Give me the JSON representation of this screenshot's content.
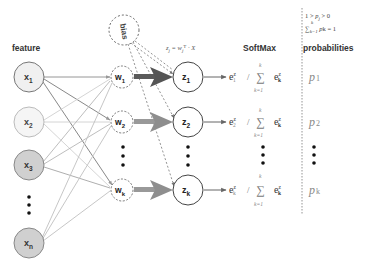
{
  "labels": {
    "feature": "feature",
    "softmax": "SoftMax",
    "probabilities": "probabilities",
    "bias": "bias",
    "linear_formula": "zj = wjT · X",
    "constraint_line1": "1 > pj > 0",
    "constraint_line2": "Σk=1 pk = 1"
  },
  "inputs": [
    {
      "id": "x1",
      "base": "x",
      "sub": "1",
      "fill": "#f0f0f0"
    },
    {
      "id": "x2",
      "base": "x",
      "sub": "2",
      "fill": "#f5f5f5"
    },
    {
      "id": "x3",
      "base": "x",
      "sub": "3",
      "fill": "#d0d0d0"
    },
    {
      "id": "xn",
      "base": "x",
      "sub": "n",
      "fill": "#d0d0d0"
    }
  ],
  "weights": [
    {
      "id": "w1",
      "base": "w",
      "sub": "1"
    },
    {
      "id": "w2",
      "base": "w",
      "sub": "2"
    },
    {
      "id": "wk",
      "base": "w",
      "sub": "k"
    }
  ],
  "logits": [
    {
      "id": "z1",
      "base": "z",
      "sub": "1"
    },
    {
      "id": "z2",
      "base": "z",
      "sub": "2"
    },
    {
      "id": "zk",
      "base": "z",
      "sub": "k"
    }
  ],
  "softmax": [
    {
      "num_base": "e",
      "num_sup": "z",
      "num_sub": "1",
      "slash": "/",
      "sum": "∑",
      "sum_top": "k",
      "sum_bottom": "k=1",
      "den_base": "e",
      "den_sup": "z",
      "den_sub": "k"
    },
    {
      "num_base": "e",
      "num_sup": "z",
      "num_sub": "2",
      "slash": "/",
      "sum": "∑",
      "sum_top": "k",
      "sum_bottom": "k=1",
      "den_base": "e",
      "den_sup": "z",
      "den_sub": "k"
    },
    {
      "num_base": "e",
      "num_sup": "z",
      "num_sub": "k",
      "slash": "/",
      "sum": "∑",
      "sum_top": "k",
      "sum_bottom": "k=1",
      "den_base": "e",
      "den_sup": "z",
      "den_sub": "k"
    }
  ],
  "outputs": [
    {
      "id": "p1",
      "base": "p",
      "sub": "1"
    },
    {
      "id": "p2",
      "base": "p",
      "sub": "2"
    },
    {
      "id": "pk",
      "base": "p",
      "sub": "k"
    }
  ],
  "colors": {
    "stroke": "#555555",
    "light_line": "#bbbbbb",
    "mid_line": "#888888",
    "thick_arrow_dark": "#5a5a5a",
    "thick_arrow_light": "#9a9a9a",
    "formula_gray": "#777777",
    "text": "#222222"
  }
}
